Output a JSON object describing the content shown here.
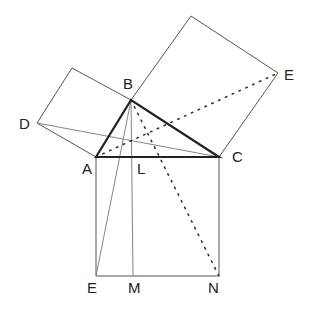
{
  "diagram": {
    "labels": {
      "B": "B",
      "D": "D",
      "E_top": "E",
      "A": "A",
      "L": "L",
      "C": "C",
      "E_bottom": "E",
      "M": "M",
      "N": "N"
    },
    "colors": {
      "thin_line": "#555555",
      "thick_line": "#222222",
      "dotted_line": "#333333",
      "label": "#222222"
    }
  }
}
